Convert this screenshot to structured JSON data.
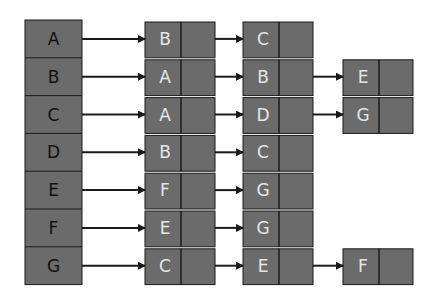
{
  "diagram": {
    "colors": {
      "node_fill": "#6b6b6b",
      "line": "#1a1a1a",
      "head_text": "#111111",
      "list_text": "#e6e6e6"
    },
    "heads": [
      "A",
      "B",
      "C",
      "D",
      "E",
      "F",
      "G"
    ],
    "lists": [
      [
        "B",
        "C"
      ],
      [
        "A",
        "B",
        "E"
      ],
      [
        "A",
        "D",
        "G"
      ],
      [
        "B",
        "C"
      ],
      [
        "F",
        "G"
      ],
      [
        "E",
        "G"
      ],
      [
        "C",
        "E",
        "F"
      ]
    ]
  }
}
